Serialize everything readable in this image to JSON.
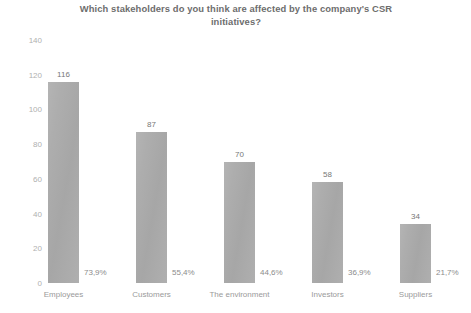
{
  "chart_data": {
    "type": "bar",
    "title": "Which stakeholders do you think are affected by the company's CSR initiatives?",
    "title_line1": "Which stakeholders do you think are affected by the company's CSR",
    "title_line2": "initiatives?",
    "xlabel": "",
    "ylabel": "",
    "ylim": [
      0,
      140
    ],
    "yticks": [
      "0",
      "20",
      "40",
      "60",
      "80",
      "100",
      "120",
      "140"
    ],
    "ytick_values": [
      0,
      20,
      40,
      60,
      80,
      100,
      120,
      140
    ],
    "grid": false,
    "legend": "none",
    "orientation": "vertical",
    "bar_color": "#a9a9a9",
    "categories": [
      "Employees",
      "Customers",
      "The environment",
      "Investors",
      "Suppliers"
    ],
    "values": [
      116,
      87,
      70,
      58,
      34
    ],
    "value_labels": [
      "116",
      "87",
      "70",
      "58",
      "34"
    ],
    "percent_labels": [
      "73,9%",
      "55,4%",
      "44,6%",
      "36,9%",
      "21,7%"
    ],
    "percent_values": [
      73.9,
      55.4,
      44.6,
      36.9,
      21.7
    ],
    "bars": [
      {
        "category": "Employees",
        "value": 116,
        "value_label": "116",
        "percent_label": "73,9%"
      },
      {
        "category": "Customers",
        "value": 87,
        "value_label": "87",
        "percent_label": "55,4%"
      },
      {
        "category": "The environment",
        "value": 70,
        "value_label": "70",
        "percent_label": "44,6%"
      },
      {
        "category": "Investors",
        "value": 58,
        "value_label": "58",
        "percent_label": "36,9%"
      },
      {
        "category": "Suppliers",
        "value": 34,
        "value_label": "34",
        "percent_label": "21,7%"
      }
    ]
  }
}
